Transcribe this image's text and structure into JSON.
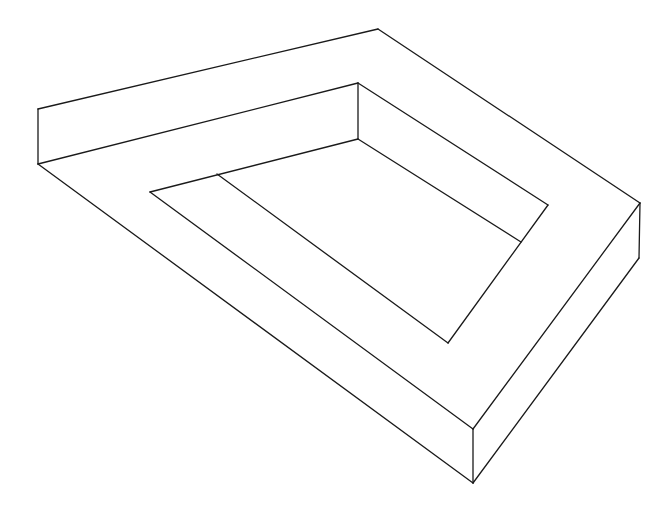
{
  "figure": {
    "width": 672,
    "height": 508,
    "background": "#ffffff",
    "stroke_color": "#1a1a1a",
    "segments": [
      {
        "name": "outer-top-edge",
        "x1": 38,
        "y1": 109,
        "x2": 378,
        "y2": 29
      },
      {
        "name": "outer-left-vertical",
        "x1": 38,
        "y1": 109,
        "x2": 38,
        "y2": 164
      },
      {
        "name": "top-bar-front-edge",
        "x1": 38,
        "y1": 164,
        "x2": 358,
        "y2": 83
      },
      {
        "name": "inner-corner-vertical",
        "x1": 358,
        "y1": 83,
        "x2": 358,
        "y2": 139
      },
      {
        "name": "outer-top-right-edge",
        "x1": 378,
        "y1": 29,
        "x2": 640,
        "y2": 203
      },
      {
        "name": "inner-top-right-edge",
        "x1": 358,
        "y1": 83,
        "x2": 548,
        "y2": 205
      },
      {
        "name": "inner-lower-right-edge",
        "x1": 358,
        "y1": 139,
        "x2": 521,
        "y2": 242
      },
      {
        "name": "inner-right-tip-to-v",
        "x1": 548,
        "y1": 205,
        "x2": 448,
        "y2": 343
      },
      {
        "name": "inner-top-left-edge",
        "x1": 150,
        "y1": 192,
        "x2": 358,
        "y2": 139
      },
      {
        "name": "inner-left-diagonal",
        "x1": 150,
        "y1": 192,
        "x2": 473,
        "y2": 429
      },
      {
        "name": "divider-diagonal",
        "x1": 217,
        "y1": 174,
        "x2": 448,
        "y2": 343
      },
      {
        "name": "outer-left-diagonal",
        "x1": 38,
        "y1": 164,
        "x2": 473,
        "y2": 483
      },
      {
        "name": "front-corner-vertical",
        "x1": 473,
        "y1": 429,
        "x2": 473,
        "y2": 483
      },
      {
        "name": "right-corner-to-front",
        "x1": 640,
        "y1": 203,
        "x2": 473,
        "y2": 429
      },
      {
        "name": "outer-right-vertical",
        "x1": 640,
        "y1": 203,
        "x2": 639,
        "y2": 258
      },
      {
        "name": "outer-bottom-right-edge",
        "x1": 639,
        "y1": 258,
        "x2": 473,
        "y2": 483
      }
    ]
  }
}
